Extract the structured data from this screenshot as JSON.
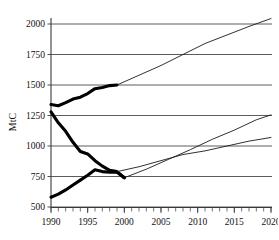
{
  "chart_data": {
    "type": "line",
    "title": "",
    "subtitle": "",
    "xlabel": "",
    "ylabel": "MtC",
    "xlim": [
      1990,
      2020
    ],
    "ylim": [
      500,
      2100
    ],
    "grid": true,
    "legend": null,
    "y_ticks": [
      500,
      750,
      1000,
      1250,
      1500,
      1750,
      2000
    ],
    "y_tick_labels": [
      "500",
      "750",
      "1000",
      "1250",
      "1500",
      "1750",
      "2000"
    ],
    "x_ticks": [
      1990,
      1995,
      2000,
      2005,
      2010,
      2015,
      2020
    ],
    "x_tick_labels": [
      "1990",
      "1995",
      "2000",
      "2005",
      "2010",
      "2015",
      "2020"
    ],
    "x_minor_tick_interval": 1,
    "series": [
      {
        "name": "upper-series-historical",
        "style": "thick",
        "x": [
          1990,
          1991,
          1992,
          1993,
          1994,
          1995,
          1996,
          1997,
          1998,
          1999
        ],
        "values": [
          1340,
          1330,
          1355,
          1385,
          1400,
          1430,
          1470,
          1480,
          1495,
          1500
        ]
      },
      {
        "name": "upper-series-projection",
        "style": "thin",
        "x": [
          1999,
          2002,
          2005,
          2008,
          2011,
          2014,
          2017,
          2020
        ],
        "values": [
          1500,
          1580,
          1660,
          1750,
          1840,
          1910,
          1980,
          2045
        ]
      },
      {
        "name": "middle-series-historical",
        "style": "thick",
        "x": [
          1990,
          1991,
          1992,
          1993,
          1994,
          1995,
          1996,
          1997,
          1998,
          1999,
          2000
        ],
        "values": [
          1280,
          1190,
          1120,
          1030,
          955,
          935,
          880,
          835,
          800,
          790,
          740
        ]
      },
      {
        "name": "middle-series-projection",
        "style": "thin",
        "x": [
          2000,
          2003,
          2006,
          2009,
          2012,
          2015,
          2018,
          2020
        ],
        "values": [
          740,
          810,
          890,
          970,
          1055,
          1130,
          1215,
          1255
        ]
      },
      {
        "name": "lower-series-historical",
        "style": "thick",
        "x": [
          1990,
          1991,
          1992,
          1993,
          1994,
          1995,
          1996,
          1997,
          1998,
          1999,
          2000
        ],
        "values": [
          580,
          605,
          640,
          680,
          720,
          760,
          805,
          790,
          785,
          785,
          740
        ]
      },
      {
        "name": "lower-series-projection",
        "style": "thin",
        "x": [
          1999,
          2002,
          2005,
          2008,
          2011,
          2014,
          2017,
          2020
        ],
        "values": [
          790,
          830,
          880,
          930,
          960,
          1000,
          1040,
          1070
        ]
      }
    ]
  },
  "colors": {
    "background": "#ffffff",
    "axis": "#3a3a3a",
    "grid": "#4a4a4a",
    "historical_line": "#000000",
    "projection_line": "#1a1a1a",
    "text": "#111111"
  }
}
